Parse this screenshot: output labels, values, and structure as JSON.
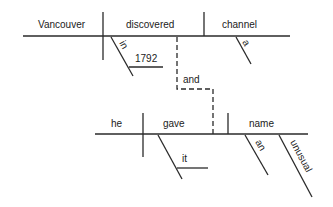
{
  "diagram": {
    "type": "sentence-diagram",
    "clause1": {
      "subject": "Vancouver",
      "verb": "discovered",
      "object": "channel",
      "object_modifier": "a",
      "prep": "in",
      "prep_object": "1792"
    },
    "conjunction": "and",
    "clause2": {
      "subject": "he",
      "verb": "gave",
      "indirect_object": "it",
      "object": "name",
      "object_modifiers": [
        "an",
        "unusual"
      ]
    }
  }
}
